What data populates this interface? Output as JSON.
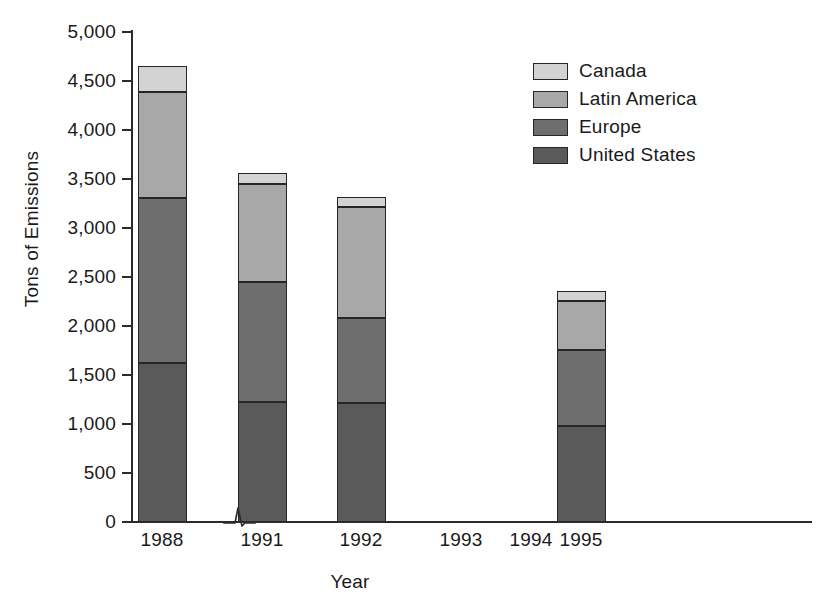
{
  "chart_data": {
    "type": "bar",
    "subtype": "stacked-bar",
    "title": "",
    "xlabel": "Year",
    "ylabel": "Tons of Emissions",
    "categories": [
      "1988",
      "1991",
      "1992",
      "1993",
      "1994",
      "1995"
    ],
    "series": [
      {
        "name": "United States",
        "color": "#5a5a5a",
        "values": [
          1620,
          1220,
          1210,
          0,
          0,
          980
        ]
      },
      {
        "name": "Europe",
        "color": "#6e6e6e",
        "values": [
          1690,
          1230,
          870,
          0,
          0,
          770
        ]
      },
      {
        "name": "Latin America",
        "color": "#a8a8a8",
        "values": [
          1080,
          1000,
          1130,
          0,
          0,
          500
        ]
      },
      {
        "name": "Canada",
        "color": "#d3d3d3",
        "values": [
          260,
          110,
          110,
          0,
          0,
          110
        ]
      }
    ],
    "totals": [
      4650,
      3560,
      3320,
      0,
      0,
      2360
    ],
    "ylim": [
      0,
      5000
    ],
    "ytick_labels": [
      "5,000",
      "4,500",
      "4,000",
      "3,500",
      "3,000",
      "2,500",
      "2,000",
      "1,500",
      "1,000",
      "500",
      "0"
    ],
    "ytick_values": [
      5000,
      4500,
      4000,
      3500,
      3000,
      2500,
      2000,
      1500,
      1000,
      500,
      0
    ],
    "grid": false,
    "legend_position": "top-right",
    "legend_order": [
      "Canada",
      "Latin America",
      "Europe",
      "United States"
    ],
    "axis_break": {
      "axis": "x",
      "between": [
        "1988",
        "1991"
      ],
      "symbol": "zigzag"
    }
  },
  "legend": {
    "items": [
      {
        "label": "Canada",
        "color": "#d3d3d3",
        "icon": "legend-swatch-icon"
      },
      {
        "label": "Latin America",
        "color": "#a8a8a8",
        "icon": "legend-swatch-icon"
      },
      {
        "label": "Europe",
        "color": "#6e6e6e",
        "icon": "legend-swatch-icon"
      },
      {
        "label": "United States",
        "color": "#5a5a5a",
        "icon": "legend-swatch-icon"
      }
    ]
  },
  "axes": {
    "y_title": "Tons of Emissions",
    "x_title": "Year"
  },
  "colors": {
    "axis": "#2b2b2b",
    "outline": "#262626",
    "background": "#ffffff",
    "text": "#1a1a1a"
  }
}
